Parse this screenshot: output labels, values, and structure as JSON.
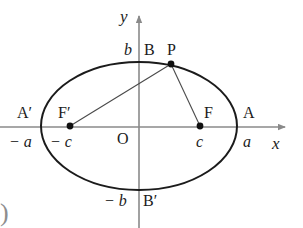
{
  "figure": {
    "type": "geometry-diagram",
    "background_color": "#ffffff",
    "ink_color": "#1b1b1b",
    "axis_color": "#8a8a8a",
    "curve_color": "#1b1b1b",
    "chord_color": "#555555"
  },
  "axes": {
    "x_label": "x",
    "y_label": "y",
    "origin_label": "O",
    "x_axis": {
      "y": 127,
      "x_start": 0,
      "x_end": 286,
      "arrow": "right"
    },
    "y_axis": {
      "x": 139,
      "y_start": 14,
      "y_end": 228,
      "arrow": "up"
    }
  },
  "ellipse": {
    "center": {
      "x": 139,
      "y": 126
    },
    "semi_major_px": 98,
    "semi_minor_px": 64,
    "semi_major_label": "a",
    "semi_minor_label": "b"
  },
  "points": [
    {
      "name": "A-prime",
      "label": "A′",
      "value_label": "− a",
      "x": 41,
      "y": 127,
      "dot": false
    },
    {
      "name": "A",
      "label": "A",
      "value_label": "a",
      "x": 237,
      "y": 127,
      "dot": false
    },
    {
      "name": "B",
      "label": "B",
      "value_label": "b",
      "x": 139,
      "y": 62,
      "dot": false
    },
    {
      "name": "B-prime",
      "label": "B′",
      "value_label": "− b",
      "x": 139,
      "y": 190,
      "dot": false
    },
    {
      "name": "focus-left",
      "label": "F′",
      "value_label": "− c",
      "x": 70,
      "y": 126,
      "dot": true
    },
    {
      "name": "focus-right",
      "label": "F",
      "value_label": "c",
      "x": 200,
      "y": 126,
      "dot": true
    },
    {
      "name": "point-p",
      "label": "P",
      "value_label": "",
      "x": 171,
      "y": 64,
      "dot": true
    }
  ],
  "segments": [
    {
      "name": "focal-radius-left",
      "from": "focus-left",
      "to": "point-p"
    },
    {
      "name": "focal-radius-right",
      "from": "focus-right",
      "to": "point-p"
    }
  ],
  "labels": {
    "a_neg": "− a",
    "a_pos": "a",
    "b_neg": "− b",
    "b_pos": "b",
    "c_neg": "− c",
    "c_pos": "c",
    "A_prime": "A′",
    "A": "A",
    "B": "B",
    "B_prime": "B′",
    "F_prime": "F′",
    "F": "F",
    "P": "P",
    "O": "O",
    "x": "x",
    "y": "y"
  },
  "artifacts": {
    "bottom_left_paren": ")"
  }
}
